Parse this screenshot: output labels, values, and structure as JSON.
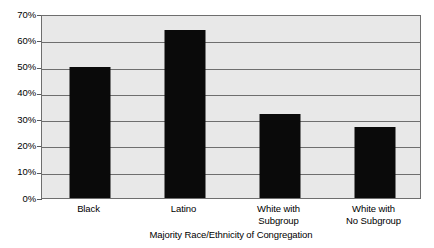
{
  "chart_data": {
    "type": "bar",
    "title": "",
    "subtitle": "",
    "xlabel": "Majority Race/Ethnicity of Congregation",
    "ylabel": "",
    "categories": [
      "Black",
      "Latino",
      "White with Subgroup",
      "White with No Subgroup"
    ],
    "category_lines": [
      [
        "Black"
      ],
      [
        "Latino"
      ],
      [
        "White with",
        "Subgroup"
      ],
      [
        "White with",
        "No Subgroup"
      ]
    ],
    "values": [
      50,
      64,
      32,
      27
    ],
    "value_labels": [
      "50%",
      "64%",
      "32%",
      "27%"
    ],
    "ylim": [
      0,
      70
    ],
    "y_ticks": [
      70,
      60,
      50,
      40,
      30,
      20,
      10,
      0
    ],
    "y_tick_labels": [
      "70%",
      "60%",
      "50%",
      "40%",
      "30%",
      "20%",
      "10%",
      "0%"
    ],
    "grid": true,
    "grid_axis": "y",
    "legend": false,
    "legend_position": "none",
    "bar_color": "#0a0a0a",
    "plot_background": "#e8e8e8",
    "axis_color": "#6e6e6e",
    "figure_background": "#ffffff"
  }
}
